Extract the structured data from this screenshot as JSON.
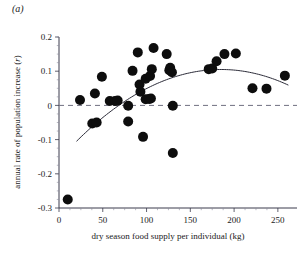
{
  "panel": {
    "label": "(a)"
  },
  "chart_data": {
    "type": "scatter",
    "title": "",
    "xlabel": "dry season food supply per individual (kg)",
    "ylabel": "annual rate of population increase (r)",
    "ylabel_symbol": "r",
    "xlim": [
      0,
      265
    ],
    "ylim": [
      -0.3,
      0.2
    ],
    "xticks": [
      0,
      50,
      100,
      150,
      200,
      250
    ],
    "xtick_labels": [
      "0",
      "50",
      "100",
      "150",
      "200",
      "250"
    ],
    "yticks": [
      0.2,
      0.1,
      0,
      -0.1,
      -0.2,
      -0.3
    ],
    "ytick_labels": [
      "0.2",
      "0.1",
      "0",
      "-0.1",
      "-0.2",
      "-0.3"
    ],
    "grid": false,
    "legend": "none",
    "reference_line": {
      "orientation": "horizontal",
      "value": 0,
      "style": "dashed"
    },
    "marker": {
      "shape": "circle",
      "color": "#0d0d0d",
      "size": 5
    },
    "points": [
      {
        "x": 10,
        "y": -0.275
      },
      {
        "x": 24,
        "y": 0.016
      },
      {
        "x": 38,
        "y": -0.053
      },
      {
        "x": 43,
        "y": -0.05
      },
      {
        "x": 41,
        "y": 0.035
      },
      {
        "x": 49,
        "y": 0.084
      },
      {
        "x": 58,
        "y": 0.013
      },
      {
        "x": 64,
        "y": 0.013
      },
      {
        "x": 67,
        "y": 0.014
      },
      {
        "x": 79,
        "y": -0.001
      },
      {
        "x": 79,
        "y": -0.047
      },
      {
        "x": 84,
        "y": 0.101
      },
      {
        "x": 90,
        "y": 0.155
      },
      {
        "x": 92,
        "y": 0.061
      },
      {
        "x": 93,
        "y": 0.04
      },
      {
        "x": 96,
        "y": -0.092
      },
      {
        "x": 99,
        "y": 0.078
      },
      {
        "x": 99,
        "y": 0.018
      },
      {
        "x": 103,
        "y": 0.019
      },
      {
        "x": 105,
        "y": 0.02
      },
      {
        "x": 104,
        "y": 0.086
      },
      {
        "x": 106,
        "y": 0.106
      },
      {
        "x": 108,
        "y": 0.168
      },
      {
        "x": 123,
        "y": 0.15
      },
      {
        "x": 126,
        "y": 0.103
      },
      {
        "x": 127,
        "y": 0.11
      },
      {
        "x": 129,
        "y": 0.097
      },
      {
        "x": 130,
        "y": -0.001
      },
      {
        "x": 130,
        "y": -0.139
      },
      {
        "x": 171,
        "y": 0.106
      },
      {
        "x": 175,
        "y": 0.108
      },
      {
        "x": 180,
        "y": 0.129
      },
      {
        "x": 189,
        "y": 0.15
      },
      {
        "x": 202,
        "y": 0.152
      },
      {
        "x": 221,
        "y": 0.05
      },
      {
        "x": 237,
        "y": 0.049
      },
      {
        "x": 258,
        "y": 0.087
      }
    ],
    "fit_curve": {
      "type": "quadratic",
      "description": "fitted quadratic regression line",
      "x_start": 20,
      "x_end": 262,
      "peak_x": 185,
      "peak_y": 0.105,
      "y_start": -0.105,
      "y_end": 0.065
    }
  }
}
